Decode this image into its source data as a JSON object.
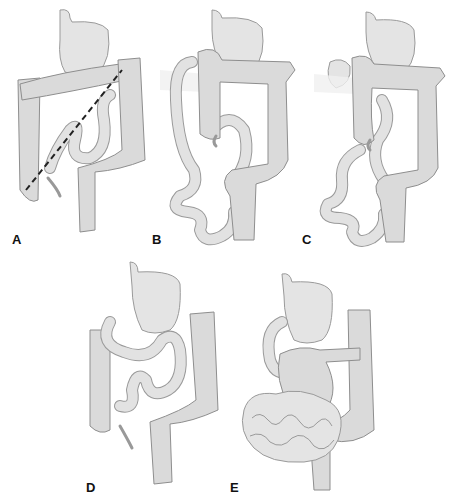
{
  "figure": {
    "colors": {
      "background": "#ffffff",
      "organ_fill": "#e4e4e4",
      "organ_outline": "#9a9a9a",
      "dashed_line": "#222222",
      "label": "#111111"
    },
    "panels": [
      {
        "id": "A",
        "label": "A",
        "annotation": "dashed diagonal line across bowel"
      },
      {
        "id": "B",
        "label": "B",
        "annotation": "bands across duodenum"
      },
      {
        "id": "C",
        "label": "C",
        "annotation": "bands across duodenum with cecum overlap"
      },
      {
        "id": "D",
        "label": "D",
        "annotation": "normal-position small bowel loop"
      },
      {
        "id": "E",
        "label": "E",
        "annotation": "coiled small bowel (volvulus)"
      }
    ]
  }
}
